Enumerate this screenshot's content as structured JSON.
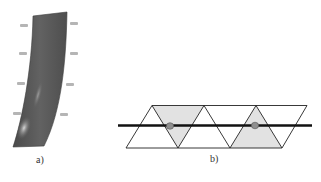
{
  "panels": [
    {
      "id": "a",
      "label": "a)",
      "description": "Shaded 3D blade surface with faint coordinate markers",
      "colors": {
        "surface": "#5c5c5c",
        "highlight": "#bdbdbd",
        "markers": "#b0b0b0"
      }
    },
    {
      "id": "b",
      "label": "b)",
      "description": "Strip of triangles crossed by a thick horizontal line; two shaded triangles each with a circular point on the line",
      "colors": {
        "triangle_stroke": "#222222",
        "shade": "#e0e0e0",
        "line": "#111111",
        "point": "#909090"
      }
    }
  ]
}
